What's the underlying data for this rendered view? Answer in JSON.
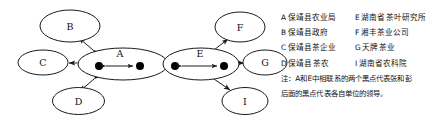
{
  "diagram": {
    "nodes": [
      {
        "id": "B",
        "label": "B",
        "cx": 70,
        "cy": 26,
        "rx": 30,
        "ry": 16
      },
      {
        "id": "C",
        "label": "C",
        "cx": 43,
        "cy": 62.5,
        "rx": 25,
        "ry": 12.5
      },
      {
        "id": "D",
        "label": "D",
        "cx": 78.5,
        "cy": 101,
        "rx": 26,
        "ry": 13.5
      },
      {
        "id": "A",
        "label": "A",
        "cx": 123,
        "cy": 64,
        "rx": 45,
        "ry": 16
      },
      {
        "id": "E",
        "label": "E",
        "cx": 201,
        "cy": 64,
        "rx": 38,
        "ry": 16
      },
      {
        "id": "F",
        "label": "F",
        "cx": 240,
        "cy": 27,
        "rx": 25,
        "ry": 15
      },
      {
        "id": "G",
        "label": "G",
        "cx": 265,
        "cy": 62.5,
        "rx": 22,
        "ry": 12.5
      },
      {
        "id": "I",
        "label": "I",
        "cx": 245,
        "cy": 101,
        "rx": 23,
        "ry": 13.5
      }
    ],
    "dots": [
      {
        "in": "A",
        "cx": 99,
        "cy": 66,
        "r": 4
      },
      {
        "in": "A",
        "cx": 140,
        "cy": 66,
        "r": 4
      },
      {
        "in": "E",
        "cx": 175,
        "cy": 66,
        "r": 4
      },
      {
        "in": "E",
        "cx": 224,
        "cy": 66,
        "r": 4
      }
    ],
    "edges": [
      {
        "from": "A",
        "to": "B",
        "type": "double"
      },
      {
        "from": "A",
        "to": "C",
        "type": "double"
      },
      {
        "from": "A",
        "to": "D",
        "type": "double"
      },
      {
        "from": "A",
        "to": "E",
        "type": "double"
      },
      {
        "from": "E",
        "to": "F",
        "type": "double"
      },
      {
        "from": "E",
        "to": "G",
        "type": "double"
      },
      {
        "from": "E",
        "to": "I",
        "type": "double"
      }
    ]
  },
  "legend": {
    "rows": [
      {
        "left_key": "A",
        "left_text": "保靖县农业局",
        "right_key": "E",
        "right_text": "湖南省茶叶研究所"
      },
      {
        "left_key": "B",
        "left_text": "保靖县政府",
        "right_key": "F",
        "right_text": "湘丰茶业公司"
      },
      {
        "left_key": "C",
        "left_text": "保靖县茶企业",
        "right_key": "G",
        "right_text": "天牌茶业"
      },
      {
        "left_key": "D",
        "left_text": "保靖县茶农",
        "right_key": "I",
        "right_text": "湖南省农科院"
      }
    ],
    "note_line1": "注：A和E中相联系的两个黑点代表张和彭",
    "note_line2": "后面的黑点代表各自单位的领导。"
  },
  "colors": {
    "stroke": "#1a1a1a",
    "dot": "#000000",
    "text": "#111111",
    "background": "#ffffff"
  }
}
